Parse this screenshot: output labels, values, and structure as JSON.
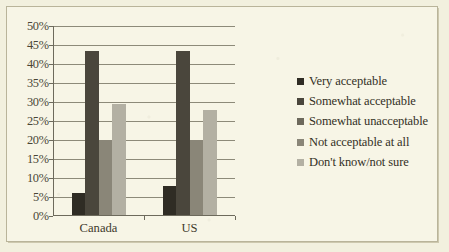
{
  "chart_data": {
    "type": "bar",
    "title": "",
    "subtitle": "",
    "xlabel": "",
    "ylabel": "",
    "categories": [
      "Canada",
      "US"
    ],
    "series": [
      {
        "name": "Very acceptable",
        "values": [
          6,
          8
        ],
        "color": "#2f2c24"
      },
      {
        "name": "Somewhat acceptable",
        "values": [
          43.5,
          43.5
        ],
        "color": "#4a463c"
      },
      {
        "name": "Somewhat unacceptable",
        "values": [
          0,
          0
        ],
        "color": "#6d695c"
      },
      {
        "name": "Not acceptable at all",
        "values": [
          20,
          20
        ],
        "color": "#8a8678"
      },
      {
        "name": "Don't know/not sure",
        "values": [
          29.5,
          28
        ],
        "color": "#b3b0a3"
      }
    ],
    "ylim": [
      0,
      50
    ],
    "ytick_step": 5,
    "ytick_labels": [
      "0%",
      "5%",
      "10%",
      "15%",
      "20%",
      "25%",
      "30%",
      "35%",
      "40%",
      "45%",
      "50%"
    ],
    "grid": true,
    "legend_position": "right",
    "value_suffix": "%"
  },
  "style": {
    "paper_background": "#f2f0de",
    "plot_background": "#f7f5e6",
    "axis_color": "#6d6a5c",
    "gridline_color": "#8d8a79",
    "text_color": "#3e3a2c",
    "frame_color": "#b9b49a"
  }
}
